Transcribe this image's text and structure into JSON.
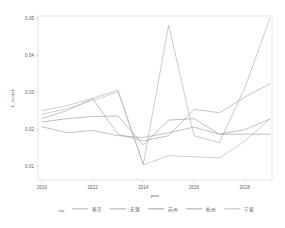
{
  "chart_data": {
    "type": "line",
    "title": "",
    "xlabel": "year",
    "ylabel": "L_score1",
    "xlim": [
      2010,
      2019
    ],
    "ylim": [
      0.01,
      0.05
    ],
    "grid": false,
    "legend_position": "bottom",
    "legend_title": "city",
    "x": [
      2010,
      2011,
      2012,
      2013,
      2014,
      2015,
      2016,
      2017,
      2018,
      2019
    ],
    "xticks": [
      "2010",
      "2012",
      "2014",
      "2016",
      "2018"
    ],
    "xtick_values": [
      2010,
      2012,
      2014,
      2016,
      2018
    ],
    "yticks": [
      "0.01",
      "0.02",
      "0.03",
      "0.04",
      "0.05"
    ],
    "ytick_values": [
      0.01,
      0.02,
      0.03,
      0.04,
      0.05
    ],
    "series": [
      {
        "name": "南京",
        "color": "#9aa4ad",
        "values": [
          0.025,
          0.0263,
          0.0283,
          0.0305,
          0.0105,
          0.0481,
          0.0182,
          0.0163,
          0.031,
          0.05
        ]
      },
      {
        "name": "无锡",
        "color": "#8d9aa3",
        "values": [
          0.0228,
          0.025,
          0.0282,
          0.0186,
          0.0168,
          0.0182,
          0.0253,
          0.0244,
          0.0286,
          0.0322
        ]
      },
      {
        "name": "苏州",
        "color": "#7e8a93",
        "values": [
          0.0219,
          0.0228,
          0.0234,
          0.0235,
          0.0157,
          0.0224,
          0.0228,
          0.0186,
          0.0186,
          0.0186
        ]
      },
      {
        "name": "杭州",
        "color": "#8b9199",
        "values": [
          0.0206,
          0.019,
          0.0196,
          0.0182,
          0.0177,
          0.019,
          0.0205,
          0.0186,
          0.0198,
          0.0227
        ]
      },
      {
        "name": "宁波",
        "color": "#a3abb2",
        "values": [
          0.024,
          0.0255,
          0.0277,
          0.03,
          0.0103,
          0.0128,
          0.0125,
          0.0122,
          0.0167,
          0.0227
        ]
      }
    ]
  },
  "axis": {
    "ylabel": "L_score1",
    "xlabel": "year"
  },
  "legend": {
    "title": "city",
    "items": [
      {
        "label": "南京"
      },
      {
        "label": "无锡"
      },
      {
        "label": "苏州"
      },
      {
        "label": "杭州"
      },
      {
        "label": "宁波"
      }
    ]
  }
}
